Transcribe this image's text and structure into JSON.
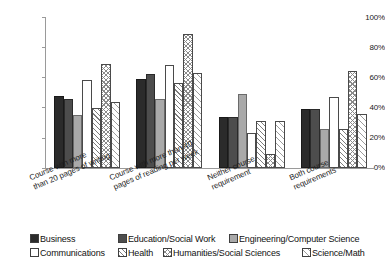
{
  "chart_data": {
    "type": "bar",
    "title": "",
    "subtitle": "",
    "xlabel": "",
    "ylabel": "",
    "ylim": [
      0,
      100
    ],
    "y_unit": "%",
    "grid": false,
    "legend_position": "bottom",
    "y_ticks": [
      "0%",
      "20%",
      "40%",
      "60%",
      "80%",
      "100%"
    ],
    "y_tick_values": [
      0,
      20,
      40,
      60,
      80,
      100
    ],
    "categories": [
      "Course with more\nthan 20 pages of writing",
      "Course with more than 40\npages of reading per week",
      "Neither course\nrequirement",
      "Both course\nrequirements"
    ],
    "series": [
      {
        "name": "Business",
        "pattern": "solid-black",
        "color": "#2b2b2b",
        "values": [
          48,
          59,
          34,
          39
        ]
      },
      {
        "name": "Education/Social Work",
        "pattern": "solid-dark",
        "color": "#4d4d4d",
        "values": [
          46,
          62,
          34,
          39
        ]
      },
      {
        "name": "Engineering/Computer Science",
        "pattern": "solid-gray",
        "color": "#a9a9a9",
        "values": [
          35,
          46,
          49,
          26
        ]
      },
      {
        "name": "Communications",
        "pattern": "empty",
        "color": "#ffffff",
        "values": [
          58,
          68,
          23,
          47
        ]
      },
      {
        "name": "Health",
        "pattern": "diagonal",
        "color": "#ffffff",
        "values": [
          40,
          56,
          31,
          26
        ]
      },
      {
        "name": "Humanities/Social Sciences",
        "pattern": "crosshatch",
        "color": "#ffffff",
        "values": [
          69,
          89,
          9,
          64
        ]
      },
      {
        "name": "Science/Math",
        "pattern": "light-diagonal",
        "color": "#ffffff",
        "values": [
          44,
          63,
          31,
          36
        ]
      }
    ]
  },
  "axis": {
    "y_labels": [
      "100%",
      "80%",
      "60%",
      "40%",
      "20%",
      "0%"
    ]
  },
  "category_labels": [
    {
      "line1": "Course with more",
      "line2": "than 20 pages of writing"
    },
    {
      "line1": "Course with more than 40",
      "line2": "pages of reading per week"
    },
    {
      "line1": "Neither course",
      "line2": "requirement"
    },
    {
      "line1": "Both course",
      "line2": "requirements"
    }
  ],
  "legend": {
    "items": [
      {
        "label": "Business"
      },
      {
        "label": "Education/Social Work"
      },
      {
        "label": "Engineering/Computer Science"
      },
      {
        "label": "Communications"
      },
      {
        "label": "Health"
      },
      {
        "label": "Humanities/Social Sciences"
      },
      {
        "label": "Science/Math"
      }
    ]
  }
}
